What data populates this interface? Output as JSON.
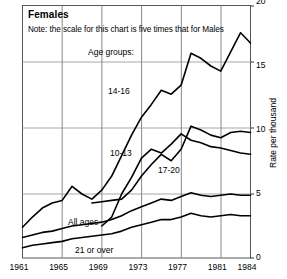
{
  "chart_data": {
    "type": "line",
    "title": "Females",
    "note": "Note: the scale for this chart is five times that for Males",
    "legend_heading": "Age groups:",
    "xlabel": "",
    "ylabel": "Rate per thousand",
    "xlim": [
      1961,
      1984
    ],
    "ylim": [
      0,
      20
    ],
    "yticks": [
      0,
      5,
      10,
      15,
      20
    ],
    "xticks": [
      1961,
      1965,
      1969,
      1973,
      1977,
      1981,
      1984
    ],
    "grid": true,
    "legend_position": "inline-annotations",
    "x": [
      1961,
      1962,
      1963,
      1964,
      1965,
      1966,
      1967,
      1968,
      1969,
      1970,
      1971,
      1972,
      1973,
      1974,
      1975,
      1976,
      1977,
      1978,
      1979,
      1980,
      1981,
      1982,
      1983,
      1984
    ],
    "series": [
      {
        "name": "14-16",
        "label": "14-16",
        "values": [
          2.4,
          3.2,
          3.9,
          4.3,
          4.5,
          5.6,
          5.0,
          4.6,
          5.3,
          6.4,
          8.0,
          9.6,
          11.0,
          12.0,
          13.1,
          12.8,
          13.5,
          16.0,
          15.6,
          15.0,
          14.6,
          16.1,
          17.6,
          16.8
        ]
      },
      {
        "name": "10-13",
        "label": "10-13",
        "values": [
          null,
          null,
          null,
          null,
          null,
          null,
          null,
          4.3,
          4.4,
          4.5,
          4.6,
          5.3,
          6.4,
          7.3,
          8.1,
          7.6,
          8.5,
          10.3,
          10.0,
          9.6,
          9.4,
          9.8,
          9.9,
          9.8
        ]
      },
      {
        "name": "17-20",
        "label": "17-20",
        "values": [
          null,
          null,
          null,
          null,
          null,
          null,
          null,
          null,
          2.5,
          3.2,
          5.0,
          6.3,
          7.8,
          8.5,
          8.2,
          8.9,
          9.7,
          9.2,
          9.0,
          8.7,
          8.6,
          8.4,
          8.2,
          8.1
        ]
      },
      {
        "name": "All ages",
        "label": "All ages",
        "values": [
          1.6,
          1.8,
          2.0,
          2.1,
          2.3,
          2.5,
          2.6,
          2.7,
          2.8,
          3.0,
          3.3,
          3.7,
          4.0,
          4.3,
          4.6,
          4.5,
          4.8,
          5.1,
          4.9,
          4.8,
          4.9,
          5.0,
          4.9,
          4.9
        ]
      },
      {
        "name": "21 or over",
        "label": "21 or over",
        "values": [
          0.8,
          1.0,
          1.1,
          1.2,
          1.3,
          1.5,
          1.6,
          1.7,
          1.8,
          1.9,
          2.1,
          2.4,
          2.6,
          2.8,
          3.0,
          3.0,
          3.2,
          3.5,
          3.3,
          3.2,
          3.3,
          3.4,
          3.3,
          3.3
        ]
      }
    ],
    "ytick_labels": [
      "0",
      "5",
      "10",
      "15",
      "20"
    ],
    "xtick_labels": [
      "1961",
      "1965",
      "1969",
      "1973",
      "1977",
      "1981",
      "1984"
    ],
    "line_color": "#000000",
    "grid_color": "#a8a8a8",
    "frame_color": "#4d4d4d",
    "background": "#ffffff"
  }
}
